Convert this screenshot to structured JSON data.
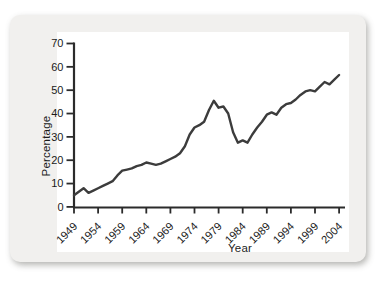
{
  "page": {
    "background_color": "#ffffff",
    "card_background_color": "#f1f0ee",
    "plot_background_color": "#ffffff"
  },
  "chart_data": {
    "type": "line",
    "title": "",
    "xlabel": "Year",
    "ylabel": "Percentage",
    "xlim": [
      1949,
      2004
    ],
    "ylim": [
      0,
      70
    ],
    "xticks": [
      1949,
      1954,
      1959,
      1964,
      1969,
      1974,
      1979,
      1984,
      1989,
      1994,
      1999,
      2004
    ],
    "yticks": [
      0,
      10,
      20,
      30,
      40,
      50,
      60,
      70
    ],
    "grid": false,
    "legend": null,
    "axis_color": "#2b2b2b",
    "line_color": "#3c3c3c",
    "x": [
      1949,
      1950,
      1951,
      1952,
      1953,
      1954,
      1955,
      1956,
      1957,
      1958,
      1959,
      1960,
      1961,
      1962,
      1963,
      1964,
      1965,
      1966,
      1967,
      1968,
      1969,
      1970,
      1971,
      1972,
      1973,
      1974,
      1975,
      1976,
      1977,
      1978,
      1979,
      1980,
      1981,
      1982,
      1983,
      1984,
      1985,
      1986,
      1987,
      1988,
      1989,
      1990,
      1991,
      1992,
      1993,
      1994,
      1995,
      1996,
      1997,
      1998,
      1999,
      2000,
      2001,
      2002,
      2003,
      2004
    ],
    "values": [
      5,
      6.5,
      8,
      6,
      7,
      8,
      9,
      10,
      11,
      13.5,
      15.5,
      16,
      16.5,
      17.5,
      18,
      19,
      18.5,
      18,
      18.5,
      19.5,
      20.5,
      21.5,
      23,
      26,
      31,
      34,
      35,
      36.5,
      41.5,
      45.5,
      42.5,
      43,
      40,
      32,
      27.5,
      28.5,
      27.5,
      31,
      34,
      36.5,
      39.5,
      40.5,
      39.5,
      42.5,
      44,
      44.5,
      46,
      48,
      49.5,
      50,
      49.5,
      51.5,
      53.5,
      52.5,
      54.5,
      56.5
    ]
  }
}
